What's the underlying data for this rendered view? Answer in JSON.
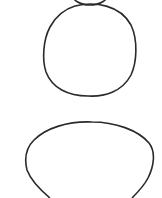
{
  "canvas": {
    "width": 162,
    "height": 198,
    "background": "#ffffff"
  },
  "stroke": {
    "color": "#2a2a2a",
    "width": 1.6
  },
  "shapes": [
    {
      "name": "top-oval",
      "cx": 90,
      "cy": -6,
      "rx": 18,
      "ry": 11
    },
    {
      "name": "middle-circle",
      "cx": 90,
      "cy": 51,
      "rx": 46,
      "ry": 46
    },
    {
      "name": "bottom-oval",
      "cx": 89,
      "cy": 168,
      "rx": 64,
      "ry": 47
    }
  ]
}
